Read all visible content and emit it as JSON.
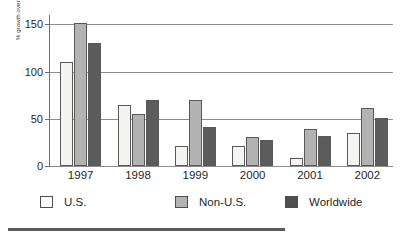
{
  "chart_data": {
    "type": "bar",
    "title": "",
    "xlabel": "",
    "ylabel": "% growth over the previous year",
    "categories": [
      "1997",
      "1998",
      "1999",
      "2000",
      "2001",
      "2002"
    ],
    "series": [
      {
        "name": "U.S.",
        "values": [
          110,
          65,
          21,
          21,
          9,
          35
        ],
        "color": "#f4f4f2"
      },
      {
        "name": "Non-U.S.",
        "values": [
          152,
          55,
          70,
          31,
          39,
          62
        ],
        "color": "#b3b3b3"
      },
      {
        "name": "Worldwide",
        "values": [
          130,
          70,
          41,
          28,
          32,
          51
        ],
        "color": "#5c5c5c"
      }
    ],
    "ylim": [
      0,
      160
    ],
    "yticks": [
      0,
      50,
      100,
      150
    ],
    "ytick_labels": [
      "0",
      "50",
      "100",
      "150"
    ],
    "grid": "horizontal",
    "legend_position": "bottom"
  },
  "legend": {
    "items": [
      {
        "label": "U.S."
      },
      {
        "label": "Non-U.S."
      },
      {
        "label": "Worldwide"
      }
    ]
  }
}
